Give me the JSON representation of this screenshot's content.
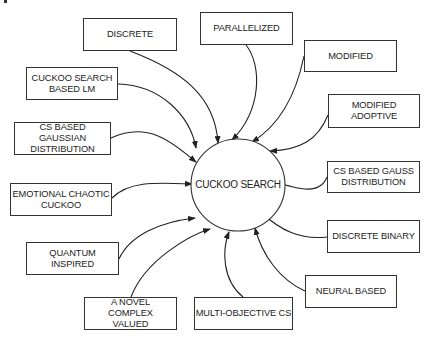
{
  "diagram": {
    "center": {
      "label": "CUCKOO SEARCH"
    },
    "nodes": [
      {
        "id": "discrete",
        "label": "DISCRETE"
      },
      {
        "id": "parallelized",
        "label": "PARALLELIZED"
      },
      {
        "id": "modified",
        "label": "MODIFIED"
      },
      {
        "id": "modified-adoptive",
        "label": "MODIFIED ADOPTIVE"
      },
      {
        "id": "cs-based-lm",
        "label": "CUCKOO SEARCH BASED LM"
      },
      {
        "id": "cs-gaussian",
        "label": "CS BASED GAUSSIAN DISTRIBUTION"
      },
      {
        "id": "emotional-chaotic",
        "label": "EMOTIONAL CHAOTIC CUCKOO"
      },
      {
        "id": "cs-gauss",
        "label": "CS BASED GAUSS DISTRIBUTION"
      },
      {
        "id": "discrete-binary",
        "label": "DISCRETE BINARY"
      },
      {
        "id": "neural-based",
        "label": "NEURAL BASED"
      },
      {
        "id": "quantum-inspired",
        "label": "QUANTUM INSPIRED"
      },
      {
        "id": "novel-complex",
        "label": "A NOVEL COMPLEX VALUED"
      },
      {
        "id": "multi-objective",
        "label": "MULTI-OBJECTIVE CS"
      }
    ],
    "edges": "all nodes point to center"
  }
}
